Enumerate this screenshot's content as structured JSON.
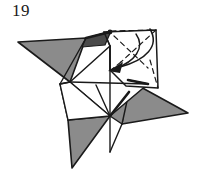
{
  "figure": {
    "step_number": "19",
    "type": "origami-folding-diagram",
    "canvas": {
      "width": 205,
      "height": 180
    },
    "colors": {
      "background": "#ffffff",
      "paper_front": "#ffffff",
      "paper_back_shaded": "#8b8b8b",
      "paper_back_dark": "#4a4a4a",
      "line": "#1a1a1a",
      "text": "#1a1a1a"
    },
    "shapes": {
      "left_wing": {
        "name": "left-point-shaded",
        "fill": "#8b8b8b",
        "points": "18,42 86,38 70,82"
      },
      "left_wing_inner": {
        "name": "left-point-inner-shaded",
        "fill": "#8b8b8b",
        "points": "60,84 96,84 68,120"
      },
      "bottom_wing": {
        "name": "bottom-point-shaded",
        "fill": "#8b8b8b",
        "points": "68,120 110,116 72,168"
      },
      "right_wing": {
        "name": "right-point-shaded",
        "fill": "#8b8b8b",
        "points": "188,113 128,80 122,124"
      },
      "right_wing_inner": {
        "name": "right-point-inner-shaded",
        "fill": "#8b8b8b",
        "points": "110,116 128,92 122,124"
      },
      "top_sliver": {
        "name": "top-dark-sliver",
        "fill": "#4a4a4a",
        "points": "86,38 110,32 104,44 80,48"
      },
      "center_white": {
        "name": "center-square-front",
        "fill": "#ffffff",
        "points": "70,82 110,46 148,84 110,116"
      },
      "flap_white": {
        "name": "folding-flap-front",
        "fill": "#ffffff",
        "points": "104,32 156,30 158,88 110,70"
      }
    },
    "solid_lines": [
      "18,42 86,38",
      "86,38 70,82",
      "70,82 18,42",
      "60,84 96,84",
      "96,84 68,120",
      "68,120 60,84",
      "68,120 110,116",
      "110,116 72,168",
      "72,168 68,120",
      "188,113 128,80",
      "128,80 122,124",
      "122,124 188,113",
      "70,82 110,46",
      "110,46 148,84",
      "148,84 110,116",
      "110,116 70,82",
      "70,82 148,84",
      "110,46 110,116",
      "110,116 110,150",
      "60,84 70,82",
      "104,32 156,30",
      "156,30 158,88",
      "104,32 110,46",
      "110,70 110,46",
      "86,38 110,32",
      "110,32 104,44",
      "128,80 148,84",
      "120,62 110,70"
    ],
    "dashed_lines": [
      "110,32 156,30",
      "156,30 120,62",
      "120,62 110,70",
      "152,62 158,88",
      "112,36 146,66"
    ],
    "arrow": {
      "name": "fold-direction-arrow",
      "description": "curved arrow from upper-right of flap sweeping down-left to center",
      "path": "M 152,30 C 158,48 140,62 118,68",
      "head_at": "110,70"
    }
  }
}
